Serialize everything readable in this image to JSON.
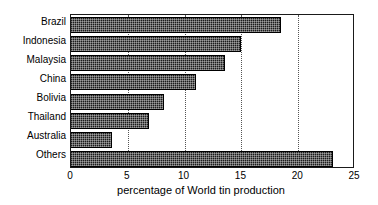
{
  "chart_data": {
    "type": "bar",
    "orientation": "horizontal",
    "title": "",
    "xlabel": "percentage of World tin production",
    "ylabel": "",
    "categories": [
      "Brazil",
      "Indonesia",
      "Malaysia",
      "China",
      "Bolivia",
      "Thailand",
      "Australia",
      "Others"
    ],
    "values": [
      18.5,
      15.0,
      13.6,
      11.0,
      8.2,
      6.9,
      3.6,
      23.1
    ],
    "xlim": [
      0,
      25
    ],
    "xticks": [
      0,
      5,
      10,
      15,
      20,
      25
    ],
    "xtick_labels": [
      "0",
      "5",
      "10",
      "15",
      "20",
      "25"
    ],
    "gridlines": [
      5,
      10,
      15,
      20
    ],
    "grid": "vertical-dotted",
    "legend": "none",
    "bar_fill": "dark-dithered-pattern",
    "bar_color": "#1c1c1c",
    "frame_color": "#1a1a1a",
    "background": "#ffffff"
  },
  "axis": {
    "x_title": "percentage of World tin production"
  }
}
